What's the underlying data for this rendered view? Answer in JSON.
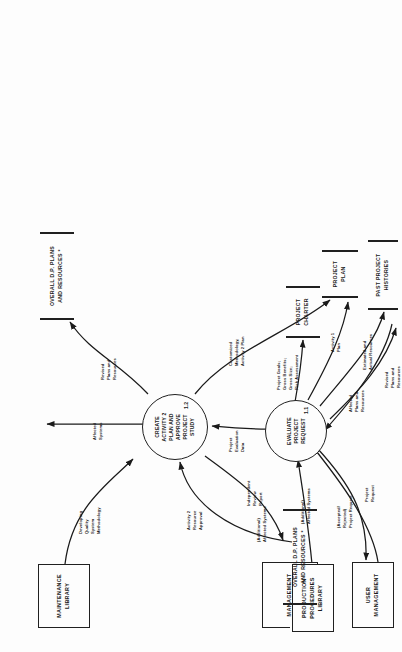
{
  "diagram": {
    "orientation": "rotated-90-ccw",
    "ink_color": "#1a1a1a",
    "paper_color": "#fdfdfd"
  },
  "entities": [
    {
      "id": "maintenance-library",
      "label": "MAINTENANCE\nLIBRARY"
    },
    {
      "id": "management",
      "label": "MANAGEMENT"
    },
    {
      "id": "production-procedures",
      "label": "PRODUCTION\nPROCEDURES\nLIBRARY"
    },
    {
      "id": "user-management",
      "label": "USER\nMANAGEMENT"
    }
  ],
  "processes": [
    {
      "id": "create-activity-2-plan",
      "label": "CREATE\nACTIVITY 2\nPLAN AND\nAPPROVE\nPROJECT\nSTUDY",
      "number": "1.2"
    },
    {
      "id": "evaluate-project-request",
      "label": "EVALUATE\nPROJECT\nREQUEST",
      "number": "1.1"
    }
  ],
  "stores": [
    {
      "id": "overall-dp-plans-top",
      "label": "OVERALL D.P.  PLANS\nAND RESOURCES *"
    },
    {
      "id": "project-charter",
      "label": "PROJECT\nCHARTER"
    },
    {
      "id": "project-plan",
      "label": "PROJECT\nPLAN"
    },
    {
      "id": "past-project-histories",
      "label": "PAST PROJECT\nHISTORIES"
    },
    {
      "id": "overall-dp-plans-bottom",
      "label": "OVERALL D.P. PLANS\nAND RESOURCES *"
    }
  ],
  "flows": [
    {
      "id": "developing-quality",
      "label": "Developing\nQuality\nSystem\nMethodology"
    },
    {
      "id": "affected-systems-top",
      "label": "Affected\nSystems"
    },
    {
      "id": "revised-plans-top",
      "label": "Revised\nPlans and\nResources"
    },
    {
      "id": "activity-2-approval",
      "label": "Activity 2\nResource\nApproval"
    },
    {
      "id": "independent-review",
      "label": "Independent\nReview\nReport"
    },
    {
      "id": "customized-method",
      "label": "Customized\nMethodology,\nActivity 2 Plan"
    },
    {
      "id": "additional-affected",
      "label": "(Additional)\nAffected Systems"
    },
    {
      "id": "project-goals",
      "label": "Project Goals;\nGross Benefits;\nGross Size;\nRisk Assessment"
    },
    {
      "id": "project-eval-data",
      "label": "Project\nEvaluation\nData"
    },
    {
      "id": "activity-1-plan",
      "label": "Activity 1\nPlan"
    },
    {
      "id": "additional-affected-2",
      "label": "(Additional)\nAffected Systems"
    },
    {
      "id": "estimated-actual",
      "label": "Estimated and\nActual Resources"
    },
    {
      "id": "accepted-rejected",
      "label": "(Accepted/\nRejected)\nProject Request"
    },
    {
      "id": "project-request",
      "label": "Project\nRequest"
    },
    {
      "id": "affected-plans-res",
      "label": "Affected\nPlans and\nResources"
    },
    {
      "id": "revised-plans-bottom",
      "label": "Revised\nPlans and\nResources"
    }
  ]
}
